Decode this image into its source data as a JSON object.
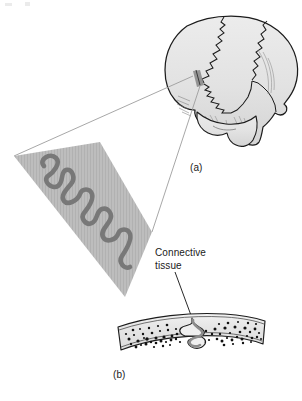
{
  "figure": {
    "panels": [
      {
        "id": "a",
        "label": "(a)",
        "caption": "Lateral view of the skull showing cranial sutures",
        "icon": "skull-lateral-illustration"
      },
      {
        "id": "b",
        "label": "(b)",
        "caption": "Cross section through a suture showing interlocking bone and connective tissue",
        "icon": "bone-cross-section-illustration"
      }
    ],
    "annotations": [
      {
        "id": "connective-tissue",
        "text": "Connective\ntissue",
        "line1": "Connective",
        "line2": "tissue"
      }
    ],
    "magnifier": {
      "icon": "magnified-suture-wedge",
      "description": "Enlarged view of the serrated suture line"
    },
    "colors": {
      "background": "#ffffff",
      "bone_fill": "#e3e3e3",
      "bone_outline": "#1c1c1c",
      "wedge_fill": "#b9b9b9",
      "suture_line": "#707070",
      "leader_line": "#9a9a9a",
      "spongy_speckle": "#111111",
      "text": "#1a1a1a"
    }
  }
}
